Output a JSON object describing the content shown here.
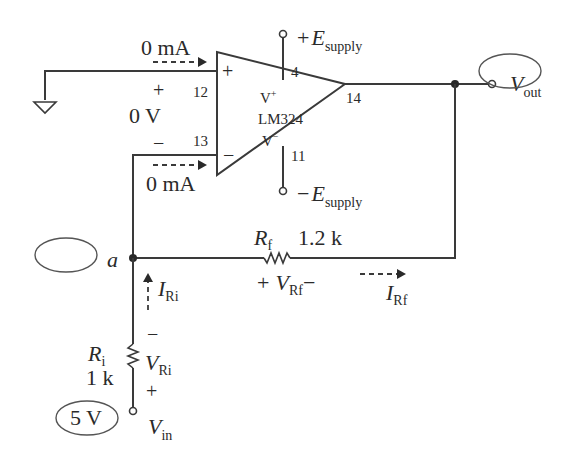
{
  "diagram": {
    "type": "op-amp inverting amplifier circuit",
    "opamp": {
      "part": "LM324",
      "vplus_label": "V",
      "vplus_sup": "+",
      "vminus_label": "V",
      "vminus_sup": "−",
      "input_plus_sign": "+",
      "input_minus_sign": "−",
      "pins": {
        "non_inverting": "12",
        "inverting": "13",
        "output": "14",
        "vpos": "4",
        "vneg": "11"
      }
    },
    "supply": {
      "pos_sign": "+",
      "neg_sign": "−",
      "symbol": "E",
      "sub": "supply"
    },
    "input_currents": {
      "non_inverting": "0 mA",
      "inverting": "0 mA"
    },
    "differential_voltage": {
      "plus": "+",
      "value": "0 V",
      "minus": "−"
    },
    "rf": {
      "symbol": "R",
      "sub": "f",
      "value": "1.2 k",
      "v_symbol": "V",
      "v_sub": "Rf",
      "v_plus": "+",
      "v_minus": "−",
      "i_symbol": "I",
      "i_sub": "Rf"
    },
    "ri": {
      "symbol": "R",
      "sub": "i",
      "value": "1 k",
      "v_symbol": "V",
      "v_sub": "Ri",
      "v_plus": "+",
      "v_minus": "−",
      "i_symbol": "I",
      "i_sub": "Ri"
    },
    "node_a": {
      "label": "a",
      "answer_oval": ""
    },
    "vin": {
      "symbol": "V",
      "sub": "in",
      "value": "5 V"
    },
    "vout": {
      "symbol": "V",
      "sub": "out",
      "answer_oval": ""
    }
  }
}
